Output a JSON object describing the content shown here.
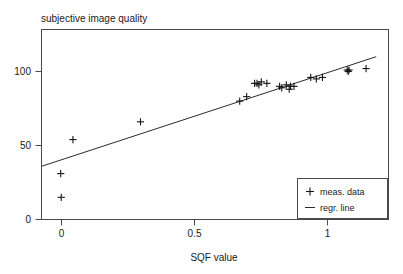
{
  "chart_data": {
    "type": "scatter",
    "title": "subjective image quality",
    "xlabel": "SQF value",
    "ylabel": "subjective image quality",
    "xlim": [
      -0.115,
      1.229
    ],
    "ylim": [
      0,
      128
    ],
    "xticks": [
      0,
      0.5,
      1
    ],
    "xtick_labels": [
      "0",
      "0.5",
      "1"
    ],
    "yticks": [
      0,
      50,
      100
    ],
    "ytick_labels": [
      "0",
      "50",
      "100"
    ],
    "grid": false,
    "legend_position": "lower right",
    "series": [
      {
        "name": "meas. data",
        "type": "scatter",
        "marker": "plus",
        "color": "#141414",
        "points": [
          [
            -0.003,
            31
          ],
          [
            -0.001,
            15
          ],
          [
            0.043,
            54
          ],
          [
            0.297,
            66
          ],
          [
            0.67,
            80
          ],
          [
            0.696,
            83
          ],
          [
            0.726,
            92
          ],
          [
            0.735,
            92
          ],
          [
            0.742,
            91
          ],
          [
            0.751,
            93
          ],
          [
            0.772,
            92
          ],
          [
            0.82,
            90
          ],
          [
            0.828,
            89
          ],
          [
            0.845,
            91
          ],
          [
            0.856,
            88
          ],
          [
            0.861,
            90
          ],
          [
            0.874,
            90
          ],
          [
            0.937,
            96
          ],
          [
            0.958,
            95
          ],
          [
            0.981,
            96
          ],
          [
            1.074,
            101
          ],
          [
            1.078,
            100
          ],
          [
            1.081,
            101
          ],
          [
            1.145,
            102
          ]
        ]
      },
      {
        "name": "regr. line",
        "type": "line",
        "color": "#2b2b2b",
        "endpoints": [
          [
            -0.074,
            36
          ],
          [
            1.183,
            110
          ]
        ],
        "slope": 58.9,
        "intercept": 40.4
      }
    ],
    "legend_entries": [
      {
        "label": "meas. data",
        "marker": "plus"
      },
      {
        "label": "regr. line",
        "marker": "line"
      }
    ]
  },
  "colors": {
    "marker": "#141414",
    "line": "#2b2b2b",
    "frame": "#4a4a4a",
    "text": "#1a1a1a",
    "background": "#ffffff"
  }
}
